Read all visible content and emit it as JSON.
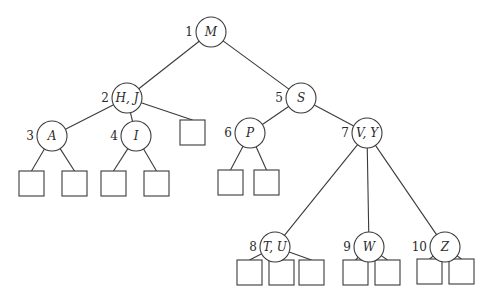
{
  "diagram": {
    "type": "B-tree",
    "nodes": [
      {
        "id": 1,
        "label": "M",
        "number": "1",
        "cx": 211,
        "cy": 32
      },
      {
        "id": 2,
        "label": "H, J",
        "number": "2",
        "cx": 127,
        "cy": 98
      },
      {
        "id": 5,
        "label": "S",
        "number": "5",
        "cx": 301,
        "cy": 98
      },
      {
        "id": 3,
        "label": "A",
        "number": "3",
        "cx": 52,
        "cy": 136
      },
      {
        "id": 4,
        "label": "I",
        "number": "4",
        "cx": 136,
        "cy": 136
      },
      {
        "id": 6,
        "label": "P",
        "number": "6",
        "cx": 250,
        "cy": 133
      },
      {
        "id": 7,
        "label": "V, Y",
        "number": "7",
        "cx": 367,
        "cy": 133
      },
      {
        "id": 8,
        "label": "T, U",
        "number": "8",
        "cx": 275,
        "cy": 247
      },
      {
        "id": 9,
        "label": "W",
        "number": "9",
        "cx": 369,
        "cy": 247
      },
      {
        "id": 10,
        "label": "Z",
        "number": "10",
        "cx": 445,
        "cy": 247
      }
    ],
    "edges": [
      [
        1,
        2
      ],
      [
        1,
        5
      ],
      [
        2,
        3
      ],
      [
        2,
        4
      ],
      [
        2,
        "L_HJ"
      ],
      [
        5,
        6
      ],
      [
        5,
        7
      ],
      [
        7,
        8
      ],
      [
        7,
        9
      ],
      [
        7,
        10
      ],
      [
        3,
        "L_A1"
      ],
      [
        3,
        "L_A2"
      ],
      [
        4,
        "L_I1"
      ],
      [
        4,
        "L_I2"
      ],
      [
        6,
        "L_P1"
      ],
      [
        6,
        "L_P2"
      ],
      [
        8,
        "L_T1"
      ],
      [
        8,
        "L_T2"
      ],
      [
        8,
        "L_T3"
      ],
      [
        9,
        "L_W1"
      ],
      [
        9,
        "L_W2"
      ],
      [
        10,
        "L_Z1"
      ],
      [
        10,
        "L_Z2"
      ]
    ],
    "leaves": [
      {
        "id": "L_HJ",
        "x": 180,
        "y": 120
      },
      {
        "id": "L_A1",
        "x": 19,
        "y": 171
      },
      {
        "id": "L_A2",
        "x": 62,
        "y": 171
      },
      {
        "id": "L_I1",
        "x": 101,
        "y": 171
      },
      {
        "id": "L_I2",
        "x": 144,
        "y": 171
      },
      {
        "id": "L_P1",
        "x": 218,
        "y": 170
      },
      {
        "id": "L_P2",
        "x": 254,
        "y": 170
      },
      {
        "id": "L_T1",
        "x": 237,
        "y": 260
      },
      {
        "id": "L_T2",
        "x": 269,
        "y": 260
      },
      {
        "id": "L_T3",
        "x": 299,
        "y": 260
      },
      {
        "id": "L_W1",
        "x": 343,
        "y": 260
      },
      {
        "id": "L_W2",
        "x": 375,
        "y": 260
      },
      {
        "id": "L_Z1",
        "x": 417,
        "y": 259
      },
      {
        "id": "L_Z2",
        "x": 449,
        "y": 259
      }
    ],
    "node_radius": 15,
    "leaf_size": 25,
    "colors": {
      "stroke": "#3a3a3a",
      "background": "#ffffff",
      "text": "#2a2a2a"
    }
  }
}
